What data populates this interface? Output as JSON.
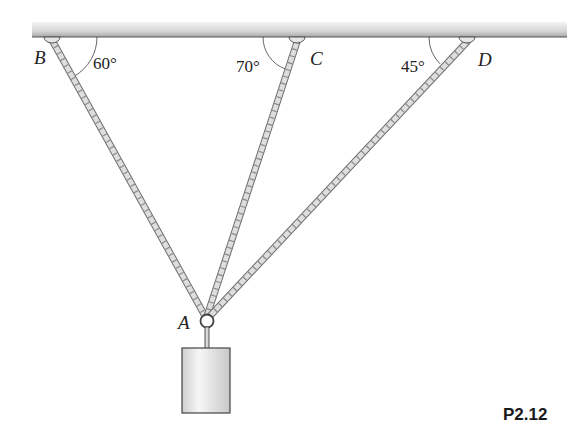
{
  "figure": {
    "problem_label": "P2.12",
    "points": {
      "B": "B",
      "C": "C",
      "D": "D",
      "A": "A"
    },
    "angles": {
      "B": "60°",
      "C": "70°",
      "D": "45°"
    },
    "colors": {
      "ceiling_light": "#ececec",
      "ceiling_dark": "#9a9a9a",
      "rope_fill": "#d9d9d9",
      "rope_stroke": "#7a7a7a",
      "weight_fill": "#e6e6e6",
      "weight_stroke": "#444444",
      "text": "#222222"
    }
  }
}
